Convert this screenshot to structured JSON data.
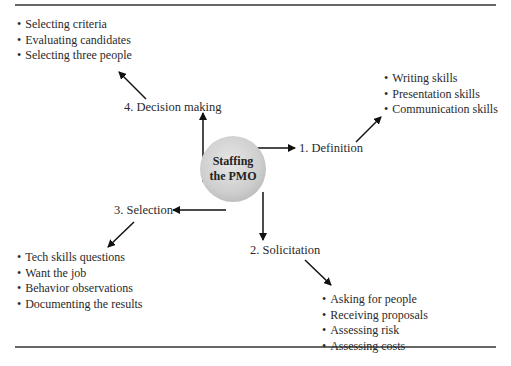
{
  "diagram": {
    "center": {
      "line1": "Staffing",
      "line2": "the PMO"
    },
    "steps": [
      {
        "label": "1. Definition",
        "items": [
          "Writing skills",
          "Presentation skills",
          "Communication skills"
        ]
      },
      {
        "label": "2. Solicitation",
        "items": [
          "Asking for people",
          "Receiving proposals",
          "Assessing risk",
          "Assessing costs"
        ]
      },
      {
        "label": "3. Selection",
        "items": [
          "Tech skills questions",
          "Want the job",
          "Behavior observations",
          "Documenting the results"
        ]
      },
      {
        "label": "4. Decision making",
        "items": [
          "Selecting criteria",
          "Evaluating candidates",
          "Selecting three people"
        ]
      }
    ]
  }
}
